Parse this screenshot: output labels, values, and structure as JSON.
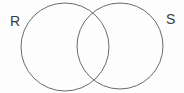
{
  "diagram": {
    "type": "venn-diagram",
    "left_set_label": "R",
    "right_set_label": "S",
    "colors": {
      "circle_stroke": "#6a6a6a",
      "label_text": "#3b3b3b",
      "background": "#fdfdfd"
    }
  }
}
